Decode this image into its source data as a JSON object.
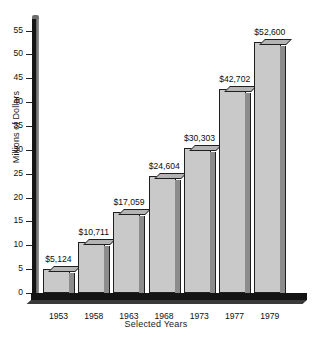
{
  "chart_data": {
    "type": "bar",
    "title": "",
    "xlabel": "Selected Years",
    "ylabel": "Millions of Dollars",
    "categories": [
      "1953",
      "1958",
      "1963",
      "1968",
      "1973",
      "1977",
      "1979"
    ],
    "values": [
      5.124,
      10.711,
      17.059,
      24.604,
      30.303,
      42.702,
      52.6
    ],
    "value_labels": [
      "$5,124",
      "$10,711",
      "$17,059",
      "$24,604",
      "$30,303",
      "$42,702",
      "$52,600"
    ],
    "ylim": [
      0,
      57
    ],
    "yticks": [
      0,
      5,
      10,
      15,
      20,
      25,
      30,
      35,
      40,
      45,
      50,
      55
    ],
    "ytick_labels": [
      "0",
      "5",
      "10",
      "15",
      "20",
      "25",
      "30",
      "35",
      "40",
      "45",
      "50",
      "55"
    ],
    "grid": false,
    "legend": false,
    "style": "3d-bars",
    "colors": {
      "bar_face": "#c9c9c9",
      "bar_side": "#8c8c8c",
      "bar_top": "#b4b4b4",
      "outline": "#1f1f1f",
      "axis": "#141414",
      "background": "#ffffff",
      "text": "#101010"
    }
  }
}
